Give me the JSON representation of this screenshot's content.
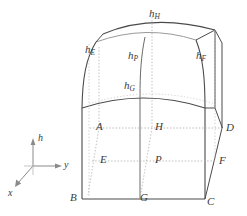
{
  "figure": {
    "type": "geometric-diagram",
    "width": 247,
    "height": 216,
    "stroke_color": "#4a4a4a",
    "light_stroke_color": "#9a9a9a",
    "dotted_color": "#a8a8a8",
    "background": "#ffffff"
  },
  "axes": {
    "name": "coordinate-triad",
    "origin": {
      "x": 33,
      "y": 166
    },
    "labels": {
      "vertical": "h",
      "horizontal": "y",
      "depth": "x"
    }
  },
  "height_labels": [
    {
      "id": "hE",
      "base": "h",
      "sub": "E",
      "x": 85,
      "y": 44
    },
    {
      "id": "hH",
      "base": "h",
      "sub": "H",
      "x": 149,
      "y": 8
    },
    {
      "id": "hP",
      "base": "h",
      "sub": "P",
      "x": 128,
      "y": 50
    },
    {
      "id": "hF",
      "base": "h",
      "sub": "F",
      "x": 196,
      "y": 50
    },
    {
      "id": "hG",
      "base": "h",
      "sub": "G",
      "x": 124,
      "y": 80
    }
  ],
  "point_labels": [
    {
      "id": "A",
      "label": "A",
      "x": 96,
      "y": 121
    },
    {
      "id": "H",
      "label": "H",
      "x": 155,
      "y": 121
    },
    {
      "id": "D",
      "label": "D",
      "x": 226,
      "y": 122
    },
    {
      "id": "E",
      "label": "E",
      "x": 100,
      "y": 154
    },
    {
      "id": "P",
      "label": "P",
      "x": 155,
      "y": 154
    },
    {
      "id": "F",
      "label": "F",
      "x": 219,
      "y": 155
    },
    {
      "id": "B",
      "label": "B",
      "x": 70,
      "y": 192
    },
    {
      "id": "G",
      "label": "G",
      "x": 140,
      "y": 192
    },
    {
      "id": "C",
      "label": "C",
      "x": 207,
      "y": 196
    }
  ]
}
